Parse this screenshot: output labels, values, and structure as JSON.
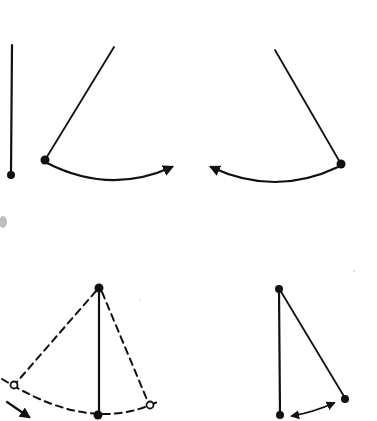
{
  "diagram": {
    "type": "pendulum-illustration",
    "background": "#ffffff",
    "ink_color": "#111111",
    "figures": [
      {
        "id": "fig-rest",
        "description": "Pendulum hanging vertically at rest",
        "pivot": [
          12,
          45
        ],
        "bob": [
          11,
          175
        ]
      },
      {
        "id": "fig-swing-right",
        "description": "Pendulum displaced left, swinging right",
        "pivot": [
          114,
          47
        ],
        "bob": [
          45,
          160
        ],
        "arc_direction": "right",
        "arc_end": [
          176,
          166
        ]
      },
      {
        "id": "fig-swing-left",
        "description": "Pendulum displaced right, swinging left",
        "pivot": [
          275,
          50
        ],
        "bob": [
          341,
          164
        ],
        "arc_direction": "left",
        "arc_end": [
          207,
          165
        ]
      },
      {
        "id": "fig-amplitude",
        "description": "Pendulum with dashed extreme positions and dashed arc path",
        "pivot": [
          99,
          288
        ],
        "bob": [
          99,
          415
        ],
        "extreme_left": [
          14,
          385
        ],
        "extreme_right": [
          150,
          405
        ],
        "motion_arrow": "down-right"
      },
      {
        "id": "fig-small-oscillation",
        "description": "Pendulum with small displacement and double-headed arrow",
        "pivot": [
          279,
          289
        ],
        "rest_bob": [
          279,
          415
        ],
        "displaced_bob": [
          345,
          399
        ],
        "arrow": "double-headed"
      }
    ]
  }
}
